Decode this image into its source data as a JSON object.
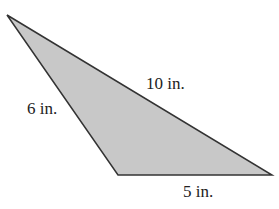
{
  "diagram": {
    "type": "triangle",
    "fill_color": "#c8c8c8",
    "stroke_color": "#333333",
    "vertices": {
      "top_left": [
        7,
        15
      ],
      "bottom_left": [
        118,
        175
      ],
      "bottom_right": [
        272,
        175
      ]
    },
    "sides": [
      {
        "name": "left",
        "label": "6 in."
      },
      {
        "name": "hypotenuse",
        "label": "10 in."
      },
      {
        "name": "bottom",
        "label": "5 in."
      }
    ]
  }
}
